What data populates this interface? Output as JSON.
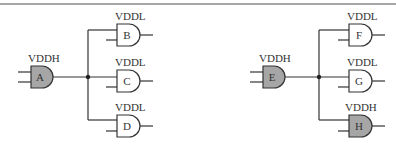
{
  "diagram": {
    "colors": {
      "high_fill": "#a6a6a6",
      "low_fill": "#ffffff",
      "stroke": "#333333"
    },
    "circuits": [
      {
        "driver": {
          "name": "A",
          "supply": "VDDH"
        },
        "fanout": [
          {
            "name": "B",
            "supply": "VDDL"
          },
          {
            "name": "C",
            "supply": "VDDL"
          },
          {
            "name": "D",
            "supply": "VDDL"
          }
        ]
      },
      {
        "driver": {
          "name": "E",
          "supply": "VDDH"
        },
        "fanout": [
          {
            "name": "F",
            "supply": "VDDL"
          },
          {
            "name": "G",
            "supply": "VDDL"
          },
          {
            "name": "H",
            "supply": "VDDH"
          }
        ]
      }
    ]
  }
}
